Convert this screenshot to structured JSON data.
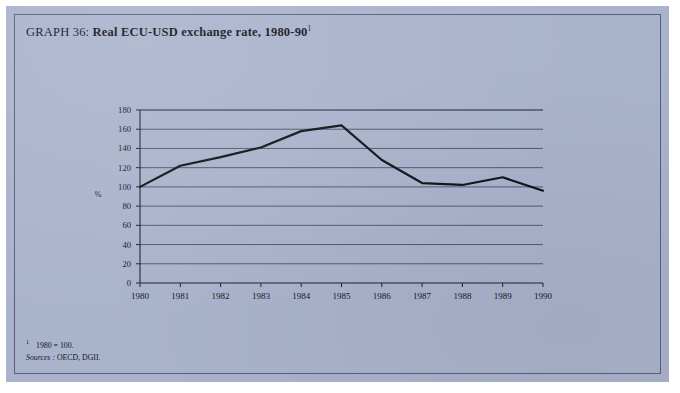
{
  "page": {
    "background_color": "#aab3cc",
    "frame_color": "#59607a"
  },
  "title": {
    "prefix": "GRAPH 36: ",
    "text": "Real ECU-USD exchange rate, 1980-90",
    "footnote_marker": "1"
  },
  "footnotes": {
    "marker": "1",
    "note": "1980 = 100.",
    "sources_label": "Sources :",
    "sources_value": "OECD, DGII."
  },
  "chart_data": {
    "type": "line",
    "title": "Real ECU-USD exchange rate, 1980-90",
    "xlabel": "",
    "ylabel": "%",
    "x": [
      1980,
      1981,
      1982,
      1983,
      1984,
      1985,
      1986,
      1987,
      1988,
      1989,
      1990
    ],
    "xtick_labels": [
      "1980",
      "1981",
      "1982",
      "1983",
      "1984",
      "1985",
      "1986",
      "1987",
      "1988",
      "1989",
      "1990"
    ],
    "xlim": [
      1980,
      1990
    ],
    "ylim": [
      0,
      180
    ],
    "ytick_values": [
      0,
      20,
      40,
      60,
      80,
      100,
      120,
      140,
      160,
      180
    ],
    "ytick_labels": [
      "0",
      "20",
      "40",
      "60",
      "80",
      "100",
      "120",
      "140",
      "160",
      "180"
    ],
    "grid": true,
    "grid_axis": "y",
    "legend": false,
    "line_color": "#12121a",
    "line_width": 2.2,
    "series": [
      {
        "name": "Real ECU-USD exchange rate",
        "values": [
          100,
          122,
          131,
          141,
          158,
          164,
          128,
          104,
          102,
          110,
          96
        ]
      }
    ]
  }
}
